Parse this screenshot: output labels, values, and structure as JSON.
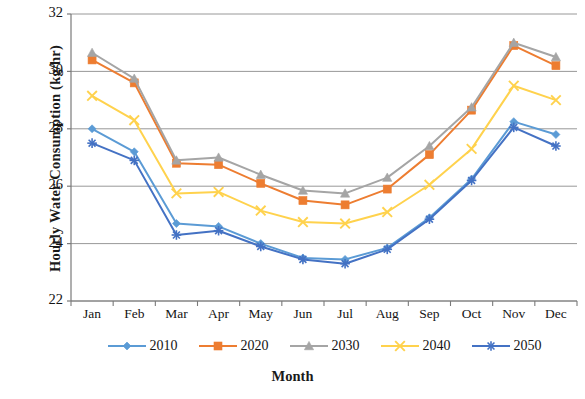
{
  "chart_data": {
    "type": "line",
    "title": "",
    "xlabel": "Month",
    "ylabel": "Hourly Water Consumption (kg/hr)",
    "categories": [
      "Jan",
      "Feb",
      "Mar",
      "Apr",
      "May",
      "Jun",
      "Jul",
      "Aug",
      "Sep",
      "Oct",
      "Nov",
      "Dec"
    ],
    "ylim": [
      22,
      32
    ],
    "yticks": [
      22,
      24,
      26,
      28,
      30,
      32
    ],
    "ytick_labels": [
      "22",
      "24",
      "26",
      "28",
      "30",
      "32"
    ],
    "grid": true,
    "grid_axis": "y",
    "legend_position": "bottom",
    "series": [
      {
        "name": "2010",
        "color": "#5B9BD5",
        "marker": "diamond",
        "values": [
          28.0,
          27.2,
          24.7,
          24.6,
          24.0,
          23.5,
          23.45,
          23.85,
          24.9,
          26.25,
          28.25,
          27.8
        ]
      },
      {
        "name": "2020",
        "color": "#ED7D31",
        "marker": "square",
        "values": [
          30.4,
          29.6,
          26.8,
          26.75,
          26.1,
          25.5,
          25.35,
          25.9,
          27.1,
          28.65,
          30.9,
          30.2
        ]
      },
      {
        "name": "2030",
        "color": "#A5A5A5",
        "marker": "triangle",
        "values": [
          30.65,
          29.75,
          26.9,
          27.0,
          26.4,
          25.85,
          25.75,
          26.3,
          27.4,
          28.75,
          31.0,
          30.5
        ]
      },
      {
        "name": "2040",
        "color": "#FFD24D",
        "marker": "cross",
        "values": [
          29.15,
          28.3,
          25.75,
          25.8,
          25.15,
          24.75,
          24.7,
          25.1,
          26.05,
          27.3,
          29.5,
          29.0
        ]
      },
      {
        "name": "2050",
        "color": "#4472C4",
        "marker": "asterisk",
        "values": [
          27.5,
          26.9,
          24.3,
          24.45,
          23.9,
          23.45,
          23.3,
          23.8,
          24.85,
          26.2,
          28.05,
          27.4
        ]
      }
    ]
  }
}
